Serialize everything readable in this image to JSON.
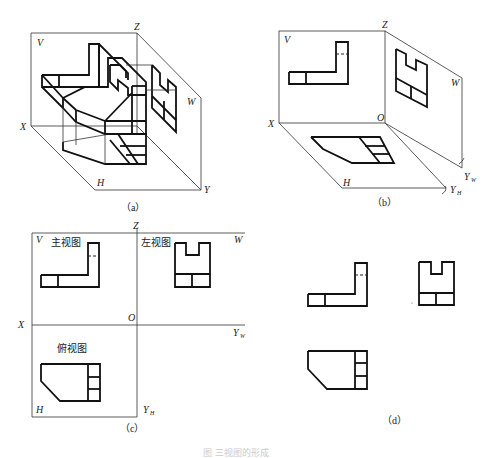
{
  "figure": {
    "caption": "图 三视图的形成",
    "panels": {
      "a": {
        "label": "（a）",
        "axes": {
          "x": "X",
          "y": "Y",
          "z": "Z"
        },
        "planes": {
          "v": "V",
          "w": "W",
          "h": "H"
        }
      },
      "b": {
        "label": "（b）",
        "axes": {
          "x": "X",
          "z": "Z",
          "o": "O",
          "yw": "Y",
          "yw_sub": "W",
          "yh": "Y",
          "yh_sub": "H"
        },
        "planes": {
          "v": "V",
          "w": "W",
          "h": "H"
        }
      },
      "c": {
        "label": "（c）",
        "axes": {
          "x": "X",
          "z": "Z",
          "o": "O",
          "yw": "Y",
          "yw_sub": "W",
          "yh": "Y",
          "yh_sub": "H"
        },
        "planes": {
          "v": "V",
          "w": "W",
          "h": "H"
        },
        "views": {
          "front": "主视图",
          "left": "左视图",
          "top": "俯视图"
        }
      },
      "d": {
        "label": "（d）"
      }
    }
  }
}
